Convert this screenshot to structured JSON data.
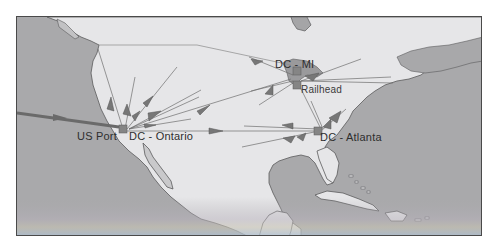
{
  "map": {
    "type": "supply-chain-network-map",
    "region": "North America",
    "colors": {
      "water": "#a9a9ab",
      "land": "#e6e6e8",
      "land_shade": "#8c8c8e",
      "coast": "#5a5a5c",
      "flow_line": "#6e6e6e",
      "arrow": "#707070",
      "node": "#858585",
      "frame": "#4a4a4a"
    },
    "nodes": [
      {
        "id": "us-port",
        "label": "US Port",
        "x": 108,
        "y": 129
      },
      {
        "id": "dc-ontario",
        "label": "DC - Ontario",
        "x": 126,
        "y": 129
      },
      {
        "id": "dc-mi",
        "label": "DC - MI",
        "x": 297,
        "y": 69
      },
      {
        "id": "railhead",
        "label": "Railhead",
        "x": 297,
        "y": 84
      },
      {
        "id": "dc-atlanta",
        "label": "DC - Atlanta",
        "x": 318,
        "y": 129
      }
    ],
    "labels": {
      "us_port": "US Port",
      "dc_ontario": "DC - Ontario",
      "dc_mi": "DC - MI",
      "railhead": "Railhead",
      "dc_atlanta": "DC - Atlanta"
    }
  }
}
